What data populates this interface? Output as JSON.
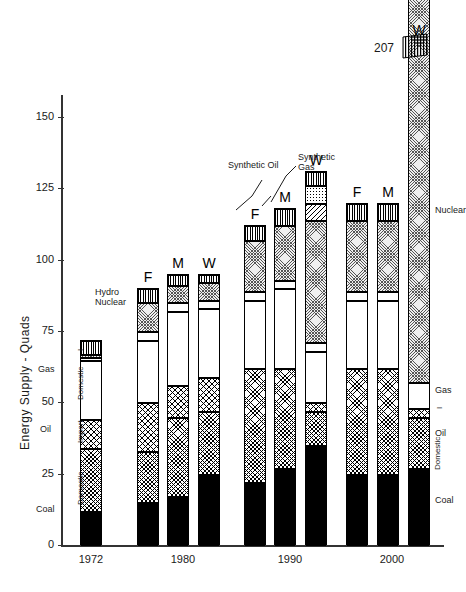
{
  "chart_data": {
    "type": "bar",
    "title": "",
    "subtitle": "",
    "xlabel": "",
    "ylabel": "Energy Supply - Quads",
    "ylim": [
      0,
      160
    ],
    "yticks": [
      0,
      25,
      50,
      75,
      100,
      125,
      150
    ],
    "ytick_labels": [
      "0",
      "25",
      "50",
      "75",
      "100",
      "125",
      "150"
    ],
    "grid": false,
    "legend_position": "inline-annotations",
    "stack_order": [
      "Coal",
      "Oil Domestic",
      "Oil Import",
      "Synthetic Oil",
      "Gas Domestic",
      "Gas Import",
      "Synthetic Gas",
      "Nuclear",
      "Hydro"
    ],
    "categories": [
      "1972",
      "1980",
      "1990",
      "2000"
    ],
    "scenarios": [
      "F",
      "M",
      "W"
    ],
    "annotations": [
      {
        "text": "Coal",
        "refers_to": "Coal"
      },
      {
        "text": "Oil",
        "refers_to": "Oil"
      },
      {
        "text": "Domestic",
        "refers_to": "Oil Domestic"
      },
      {
        "text": "Import",
        "refers_to": "Oil Import"
      },
      {
        "text": "Gas",
        "refers_to": "Gas"
      },
      {
        "text": "Domestic",
        "refers_to": "Gas Domestic"
      },
      {
        "text": "I",
        "refers_to": "Gas Import"
      },
      {
        "text": "Hydro",
        "refers_to": "Hydro"
      },
      {
        "text": "Nuclear",
        "refers_to": "Nuclear"
      },
      {
        "text": "Synthetic Oil",
        "refers_to": "Synthetic Oil"
      },
      {
        "text": "Synthetic Gas",
        "refers_to": "Synthetic Gas"
      },
      {
        "text": "207",
        "refers_to": "2000 W total (off-scale)"
      }
    ],
    "bars": [
      {
        "year": "1972",
        "scenario": "",
        "total": 72,
        "segments": [
          {
            "name": "Coal",
            "value": 12,
            "pattern": "solid-black"
          },
          {
            "name": "Oil Domestic",
            "value": 22,
            "pattern": "fine-crosshatch"
          },
          {
            "name": "Oil Import",
            "value": 10,
            "pattern": "crosshatch"
          },
          {
            "name": "Gas Domestic",
            "value": 21,
            "pattern": "white"
          },
          {
            "name": "Gas Import",
            "value": 1,
            "pattern": "white"
          },
          {
            "name": "Nuclear",
            "value": 1,
            "pattern": "stipple"
          },
          {
            "name": "Hydro",
            "value": 5,
            "pattern": "vertical-lines"
          }
        ]
      },
      {
        "year": "1980",
        "scenario": "F",
        "total": 90,
        "segments": [
          {
            "name": "Coal",
            "value": 15,
            "pattern": "solid-black"
          },
          {
            "name": "Oil Domestic",
            "value": 18,
            "pattern": "fine-crosshatch"
          },
          {
            "name": "Oil Import",
            "value": 17,
            "pattern": "crosshatch"
          },
          {
            "name": "Gas Domestic",
            "value": 22,
            "pattern": "white"
          },
          {
            "name": "Gas Import",
            "value": 3,
            "pattern": "white"
          },
          {
            "name": "Nuclear",
            "value": 10,
            "pattern": "stipple"
          },
          {
            "name": "Hydro",
            "value": 5,
            "pattern": "vertical-lines"
          }
        ]
      },
      {
        "year": "1980",
        "scenario": "M",
        "total": 95,
        "segments": [
          {
            "name": "Coal",
            "value": 17,
            "pattern": "solid-black"
          },
          {
            "name": "Oil Domestic",
            "value": 28,
            "pattern": "fine-crosshatch"
          },
          {
            "name": "Oil Import",
            "value": 11,
            "pattern": "crosshatch"
          },
          {
            "name": "Gas Domestic",
            "value": 26,
            "pattern": "white"
          },
          {
            "name": "Gas Import",
            "value": 3,
            "pattern": "white"
          },
          {
            "name": "Nuclear",
            "value": 6,
            "pattern": "stipple"
          },
          {
            "name": "Hydro",
            "value": 4,
            "pattern": "vertical-lines"
          }
        ]
      },
      {
        "year": "1980",
        "scenario": "W",
        "total": 95,
        "segments": [
          {
            "name": "Coal",
            "value": 25,
            "pattern": "solid-black"
          },
          {
            "name": "Oil Domestic",
            "value": 22,
            "pattern": "fine-crosshatch"
          },
          {
            "name": "Oil Import",
            "value": 12,
            "pattern": "crosshatch"
          },
          {
            "name": "Gas Domestic",
            "value": 24,
            "pattern": "white"
          },
          {
            "name": "Gas Import",
            "value": 3,
            "pattern": "white"
          },
          {
            "name": "Nuclear",
            "value": 6,
            "pattern": "stipple"
          },
          {
            "name": "Hydro",
            "value": 3,
            "pattern": "vertical-lines"
          }
        ]
      },
      {
        "year": "1990",
        "scenario": "F",
        "total": 112,
        "segments": [
          {
            "name": "Coal",
            "value": 22,
            "pattern": "solid-black"
          },
          {
            "name": "Oil Domestic",
            "value": 40,
            "pattern": "fine-crosshatch"
          },
          {
            "name": "Gas Domestic",
            "value": 24,
            "pattern": "white"
          },
          {
            "name": "Gas Import",
            "value": 3,
            "pattern": "white"
          },
          {
            "name": "Nuclear",
            "value": 18,
            "pattern": "stipple"
          },
          {
            "name": "Hydro",
            "value": 5,
            "pattern": "vertical-lines"
          }
        ]
      },
      {
        "year": "1990",
        "scenario": "M",
        "total": 118,
        "segments": [
          {
            "name": "Coal",
            "value": 27,
            "pattern": "solid-black"
          },
          {
            "name": "Oil Domestic",
            "value": 35,
            "pattern": "fine-crosshatch"
          },
          {
            "name": "Gas Domestic",
            "value": 28,
            "pattern": "white"
          },
          {
            "name": "Gas Import",
            "value": 3,
            "pattern": "white"
          },
          {
            "name": "Nuclear",
            "value": 19,
            "pattern": "stipple"
          },
          {
            "name": "Hydro",
            "value": 6,
            "pattern": "vertical-lines"
          }
        ]
      },
      {
        "year": "1990",
        "scenario": "W",
        "total": 131,
        "segments": [
          {
            "name": "Coal",
            "value": 35,
            "pattern": "solid-black"
          },
          {
            "name": "Oil Domestic",
            "value": 12,
            "pattern": "fine-crosshatch"
          },
          {
            "name": "Oil Import",
            "value": 3,
            "pattern": "crosshatch"
          },
          {
            "name": "Gas Domestic",
            "value": 18,
            "pattern": "white"
          },
          {
            "name": "Gas Import",
            "value": 3,
            "pattern": "white"
          },
          {
            "name": "Nuclear",
            "value": 43,
            "pattern": "stipple"
          },
          {
            "name": "Synthetic Oil",
            "value": 6,
            "pattern": "diagonal-lines"
          },
          {
            "name": "Synthetic Gas",
            "value": 6,
            "pattern": "dots"
          },
          {
            "name": "Hydro",
            "value": 5,
            "pattern": "vertical-lines"
          }
        ]
      },
      {
        "year": "2000",
        "scenario": "F",
        "total": 120,
        "segments": [
          {
            "name": "Coal",
            "value": 25,
            "pattern": "solid-black"
          },
          {
            "name": "Oil Domestic",
            "value": 37,
            "pattern": "fine-crosshatch"
          },
          {
            "name": "Gas Domestic",
            "value": 24,
            "pattern": "white"
          },
          {
            "name": "Gas Import",
            "value": 3,
            "pattern": "white"
          },
          {
            "name": "Nuclear",
            "value": 25,
            "pattern": "stipple"
          },
          {
            "name": "Hydro",
            "value": 6,
            "pattern": "vertical-lines"
          }
        ]
      },
      {
        "year": "2000",
        "scenario": "M",
        "total": 120,
        "segments": [
          {
            "name": "Coal",
            "value": 25,
            "pattern": "solid-black"
          },
          {
            "name": "Oil Domestic",
            "value": 37,
            "pattern": "fine-crosshatch"
          },
          {
            "name": "Gas Domestic",
            "value": 24,
            "pattern": "white"
          },
          {
            "name": "Gas Import",
            "value": 3,
            "pattern": "white"
          },
          {
            "name": "Nuclear",
            "value": 25,
            "pattern": "stipple"
          },
          {
            "name": "Hydro",
            "value": 6,
            "pattern": "vertical-lines"
          }
        ]
      },
      {
        "year": "2000",
        "scenario": "W",
        "total": 207,
        "off_scale": true,
        "total_label": "207",
        "segments": [
          {
            "name": "Coal",
            "value": 27,
            "pattern": "solid-black"
          },
          {
            "name": "Oil Domestic",
            "value": 18,
            "pattern": "fine-crosshatch"
          },
          {
            "name": "Oil Import",
            "value": 3,
            "pattern": "crosshatch"
          },
          {
            "name": "Gas Domestic",
            "value": 9,
            "pattern": "white"
          },
          {
            "name": "Nuclear",
            "value": 144,
            "pattern": "stipple"
          },
          {
            "name": "Hydro",
            "value": 6,
            "pattern": "vertical-lines"
          }
        ]
      }
    ]
  }
}
